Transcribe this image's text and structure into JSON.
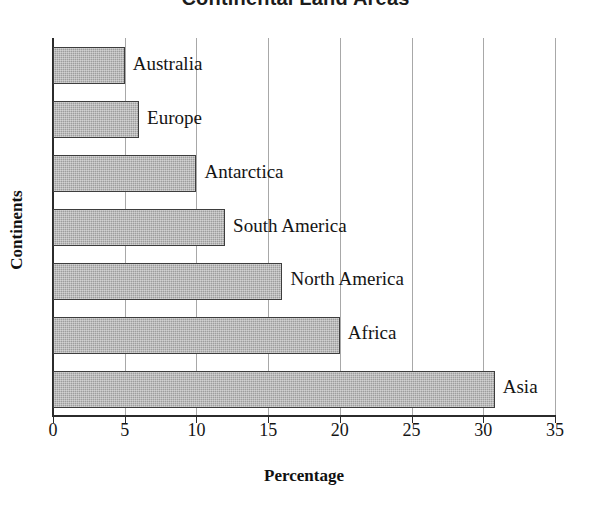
{
  "chart_data": {
    "type": "bar",
    "orientation": "horizontal",
    "title": "Continental Land Areas",
    "xlabel": "Percentage",
    "ylabel": "Continents",
    "categories": [
      "Australia",
      "Europe",
      "Antarctica",
      "South America",
      "North America",
      "Africa",
      "Asia"
    ],
    "values": [
      5,
      6,
      10,
      12,
      16,
      20,
      30.8
    ],
    "xlim": [
      0,
      35
    ],
    "xticks": [
      0,
      5,
      10,
      15,
      20,
      25,
      30,
      35
    ],
    "xtick_labels": [
      "0",
      "5",
      "10",
      "15",
      "20",
      "25",
      "30",
      "35"
    ],
    "grid": "vertical",
    "legend": "none",
    "bar_fill_color": "#9d9d9d",
    "bar_border_color": "#3d3d3d",
    "axis_color": "#2b2b2b",
    "gridline_color": "#a8a8a8",
    "bar_labels_inline": true
  }
}
